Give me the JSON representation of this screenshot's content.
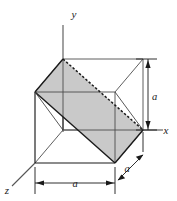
{
  "figure": {
    "axes": [
      {
        "name": "y-axis",
        "label": "y",
        "label_x": 74,
        "label_y": 16
      },
      {
        "name": "x-axis",
        "label": "x",
        "label_x": 166,
        "label_y": 135
      },
      {
        "name": "z-axis",
        "label": "z",
        "label_x": 7,
        "label_y": 192
      }
    ],
    "dimensions": [
      {
        "name": "vertical-height",
        "label": "a",
        "label_x": 152,
        "label_y": 100
      },
      {
        "name": "bottom-width",
        "label": "a",
        "label_x": 71,
        "label_y": 187
      },
      {
        "name": "depth-diagonal",
        "label": "a",
        "label_x": 129,
        "label_y": 168
      }
    ],
    "colors": {
      "line": "#1a1a1a",
      "thin_line": "#4d4d4d",
      "shade_fill": "#c9c9c9",
      "shade_fill_alt": "#bdbdbd",
      "background": "#ffffff"
    },
    "geometry": {
      "cube_vertices": {
        "front_bottom_left": [
          35,
          163
        ],
        "front_bottom_right": [
          115,
          163
        ],
        "front_top_left": [
          35,
          92
        ],
        "front_top_right": [
          115,
          92
        ],
        "back_bottom_left": [
          63,
          130
        ],
        "back_bottom_right": [
          143,
          130
        ],
        "back_top_left": [
          63,
          59
        ],
        "back_top_right": [
          143,
          59
        ]
      },
      "shaded_plane_vertices": [
        [
          35,
          92
        ],
        [
          115,
          163
        ],
        [
          143,
          130
        ],
        [
          63,
          59
        ]
      ]
    }
  }
}
